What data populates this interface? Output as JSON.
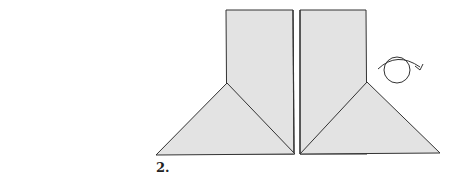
{
  "diagram": {
    "step_label": "2.",
    "colors": {
      "paper_fill": "#e3e3e3",
      "stroke": "#333333",
      "background": "#ffffff"
    },
    "shapes": {
      "left_panel": "rectangle",
      "right_panel": "rectangle",
      "left_flap": "triangle",
      "right_flap": "triangle",
      "turn_over_symbol": "turn-over-icon"
    }
  }
}
